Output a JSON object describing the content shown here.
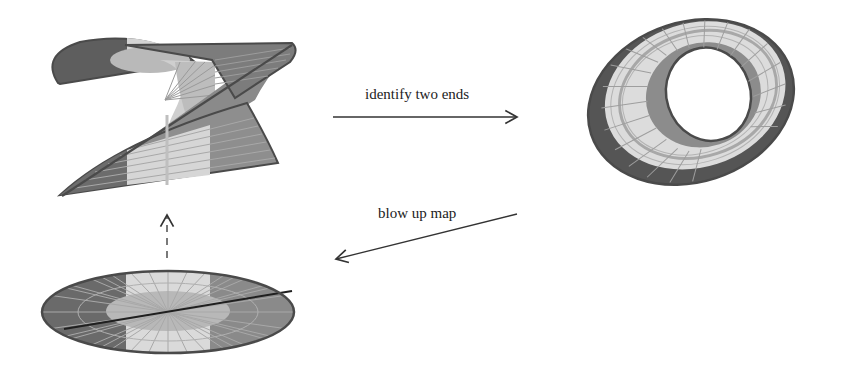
{
  "diagram": {
    "nodes": [
      {
        "id": "helicoid",
        "description": "twisted helicoidal strip with radial rulings"
      },
      {
        "id": "mobius-loop",
        "description": "closed twisted band (Möbius-like loop)"
      },
      {
        "id": "disc",
        "description": "flat elliptical disc with radial rulings and a diameter line"
      }
    ],
    "edges": [
      {
        "from": "helicoid",
        "to": "mobius-loop",
        "label": "identify two ends",
        "style": "solid"
      },
      {
        "from": "mobius-loop",
        "to": "disc",
        "label": "blow up map",
        "style": "solid"
      },
      {
        "from": "disc",
        "to": "helicoid",
        "label": "",
        "style": "dashed"
      }
    ]
  },
  "labels": {
    "identify": "identify two ends",
    "blowup": "blow up map"
  },
  "colors": {
    "dark": "#5a5a5a",
    "mid": "#8e8e8e",
    "light": "#d9d9d9",
    "rim": "#4a4a4a",
    "arrow": "#333333"
  }
}
